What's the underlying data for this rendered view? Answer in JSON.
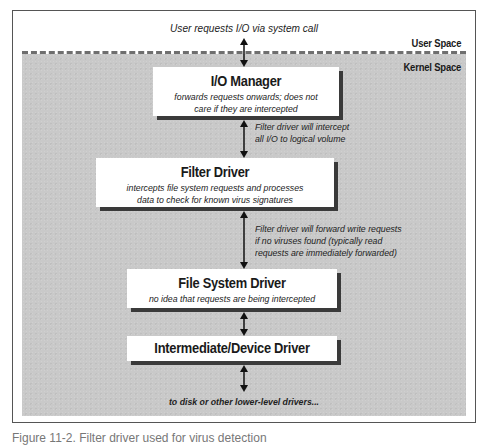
{
  "diagram": {
    "top_caption": "User requests I/O via system call",
    "regions": {
      "user_space": "User Space",
      "kernel_space": "Kernel Space"
    },
    "boxes": [
      {
        "title": "I/O Manager",
        "description_lines": [
          "forwards requests onwards; does not",
          "care if they are intercepted"
        ]
      },
      {
        "title": "Filter Driver",
        "description_lines": [
          "intercepts file system requests and processes",
          "data to check for known virus signatures"
        ]
      },
      {
        "title": "File System Driver",
        "description_lines": [
          "no idea that requests are being intercepted"
        ]
      },
      {
        "title": "Intermediate/Device Driver",
        "description_lines": []
      }
    ],
    "edge_notes": [
      {
        "between": [
          "I/O Manager",
          "Filter Driver"
        ],
        "lines": [
          "Filter driver will intercept",
          "all I/O to logical volume"
        ]
      },
      {
        "between": [
          "Filter Driver",
          "File System Driver"
        ],
        "lines": [
          "Filter driver will forward write requests",
          "if no viruses found (typically read",
          "requests are immediately forwarded)"
        ]
      }
    ],
    "bottom_caption": "to disk or other lower-level drivers...",
    "figure_caption": "Figure 11-2. Filter driver used for virus detection"
  },
  "colors": {
    "kernel_fill": "#c9c9c9",
    "box_fill": "#ffffff",
    "box_shadow": "#3a3a3a",
    "dash_line": "#6e6e6e",
    "frame_border": "#555555"
  }
}
